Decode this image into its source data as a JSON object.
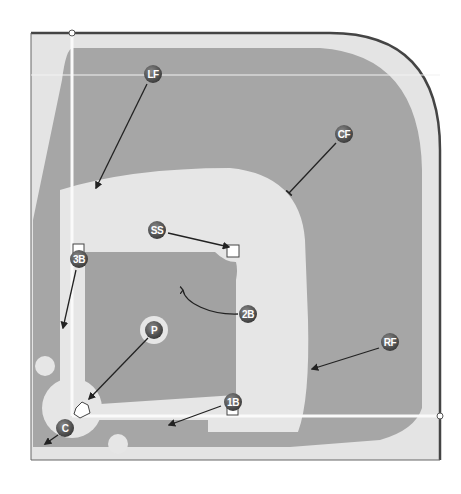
{
  "diagram": {
    "colors": {
      "background": "#ffffff",
      "border": "#444444",
      "warning_track": "#e4e4e4",
      "outfield_grass": "#a6a6a6",
      "infield_dirt": "#e6e6e6",
      "infield_grass": "#a2a2a2",
      "foul_line": "#ffffff",
      "marker_fill": "#555555",
      "marker_text": "#ffffff",
      "arrow": "#222222"
    },
    "positions": [
      {
        "id": "LF",
        "label": "LF",
        "name": "Left Field",
        "x": 153,
        "y": 74
      },
      {
        "id": "CF",
        "label": "CF",
        "name": "Center Field",
        "x": 344,
        "y": 134
      },
      {
        "id": "SS",
        "label": "SS",
        "name": "Shortstop",
        "x": 157,
        "y": 230
      },
      {
        "id": "3B",
        "label": "3B",
        "name": "Third Base",
        "x": 79,
        "y": 259
      },
      {
        "id": "2B",
        "label": "2B",
        "name": "Second Base",
        "x": 248,
        "y": 314
      },
      {
        "id": "P",
        "label": "P",
        "name": "Pitcher",
        "x": 154,
        "y": 330
      },
      {
        "id": "RF",
        "label": "RF",
        "name": "Right Field",
        "x": 390,
        "y": 342
      },
      {
        "id": "1B",
        "label": "1B",
        "name": "First Base",
        "x": 233,
        "y": 402
      },
      {
        "id": "C",
        "label": "C",
        "name": "Catcher",
        "x": 65,
        "y": 428
      }
    ],
    "arrows": [
      {
        "from": "LF",
        "x1": 147,
        "y1": 84,
        "x2": 96,
        "y2": 188,
        "head": "arrow"
      },
      {
        "from": "CF",
        "x1": 336,
        "y1": 143,
        "x2": 289,
        "y2": 193,
        "head": "bar"
      },
      {
        "from": "SS",
        "x1": 168,
        "y1": 233,
        "x2": 229,
        "y2": 247,
        "head": "arrow"
      },
      {
        "from": "3B",
        "x1": 76,
        "y1": 270,
        "x2": 63,
        "y2": 328,
        "head": "arrow"
      },
      {
        "from": "2B",
        "path": "M238,314 C210,315 185,303 183,290",
        "head": "hook"
      },
      {
        "from": "P",
        "x1": 148,
        "y1": 338,
        "x2": 89,
        "y2": 399,
        "head": "arrow"
      },
      {
        "from": "RF",
        "x1": 379,
        "y1": 348,
        "x2": 312,
        "y2": 369,
        "head": "arrow"
      },
      {
        "from": "1B",
        "x1": 221,
        "y1": 406,
        "x2": 169,
        "y2": 425,
        "head": "arrow"
      },
      {
        "from": "C",
        "x1": 58,
        "y1": 435,
        "x2": 45,
        "y2": 444,
        "head": "arrow"
      }
    ],
    "bases": [
      {
        "id": "second-base",
        "x": 227,
        "y": 245,
        "size": 12
      },
      {
        "id": "third-base",
        "x": 73,
        "y": 244,
        "size": 11
      },
      {
        "id": "first-base",
        "x": 227,
        "y": 404,
        "size": 11
      }
    ],
    "foul_line_endpoints": [
      {
        "id": "left-foul-pole",
        "x": 72,
        "y": 33
      },
      {
        "id": "right-foul-pole",
        "x": 440,
        "y": 416
      }
    ]
  }
}
